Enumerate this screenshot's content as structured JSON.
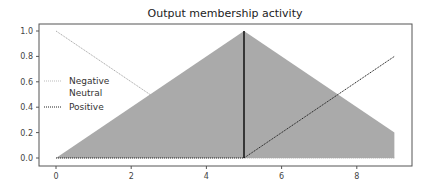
{
  "chart_data": {
    "type": "line",
    "title": "Output membership activity",
    "xlabel": "",
    "ylabel": "",
    "xlim": [
      -0.45,
      9.45
    ],
    "ylim": [
      -0.05,
      1.05
    ],
    "xticks": [
      0,
      2,
      4,
      6,
      8
    ],
    "xtick_labels": [
      "0",
      "2",
      "4",
      "6",
      "8"
    ],
    "yticks": [
      0.0,
      0.2,
      0.4,
      0.6,
      0.8,
      1.0
    ],
    "ytick_labels": [
      "0.0",
      "0.2",
      "0.4",
      "0.6",
      "0.8",
      "1.0"
    ],
    "grid": false,
    "legend_position": "center left",
    "series": [
      {
        "name": "Negative",
        "style": "dotted",
        "color": "#aaaaaa",
        "x": [
          0,
          5,
          9
        ],
        "y": [
          1.0,
          0.0,
          0.0
        ]
      },
      {
        "name": "Neutral",
        "style": "none",
        "color": "#ffffff",
        "x": [
          0,
          5,
          9
        ],
        "y": [
          0.0,
          1.0,
          0.2
        ]
      },
      {
        "name": "Positive",
        "style": "dotted",
        "color": "#222222",
        "x": [
          0,
          5,
          9
        ],
        "y": [
          0.0,
          0.0,
          0.8
        ]
      }
    ],
    "filled_area": {
      "label": "activation",
      "color": "#aaaaaa",
      "x": [
        0,
        5,
        9
      ],
      "y_upper": [
        0.0,
        1.0,
        0.2
      ],
      "y_lower": [
        0.0,
        0.0,
        0.0
      ]
    },
    "vertical_line": {
      "x": 5,
      "ymin": 0.0,
      "ymax": 1.0,
      "color": "#111111"
    }
  },
  "legend": {
    "items": [
      {
        "label": "Negative"
      },
      {
        "label": "Neutral"
      },
      {
        "label": "Positive"
      }
    ]
  }
}
